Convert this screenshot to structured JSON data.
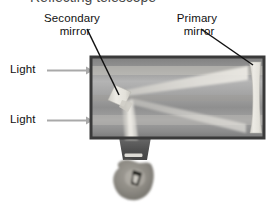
{
  "figure": {
    "kind": "reflecting-telescope-diagram",
    "title_fragment": "Reflecting telescope",
    "background_color": "#ffffff",
    "text_color": "#111111"
  },
  "labels": {
    "secondary_mirror": {
      "line1": "Secondary",
      "line2": "mirror"
    },
    "primary_mirror": {
      "line1": "Primary",
      "line2": "mirror"
    },
    "light_upper": "Light",
    "light_lower": "Light"
  },
  "parts": {
    "tube": {
      "name": "telescope-tube",
      "border_color": "#3b3b3b",
      "fill_top": "#8e8e8e",
      "fill_mid": "#a6a6a6",
      "fill_bottom": "#9b9b9b"
    },
    "primary_mirror": {
      "name": "primary-mirror",
      "color": "#e6e4de"
    },
    "secondary_mirror": {
      "name": "secondary-mirror",
      "color": "#e3e1db"
    },
    "eyepiece": {
      "name": "eyepiece",
      "color": "#5a5a5a"
    },
    "eye": {
      "name": "observer-eye",
      "color": "#8d8a84"
    },
    "light_beam": {
      "name": "light-beam",
      "color": "#dedcd6"
    },
    "incoming_arrow": {
      "name": "incoming-light-arrow",
      "color": "#a8a8a8"
    },
    "leader_line": {
      "name": "leader-line",
      "color": "#111111"
    }
  }
}
